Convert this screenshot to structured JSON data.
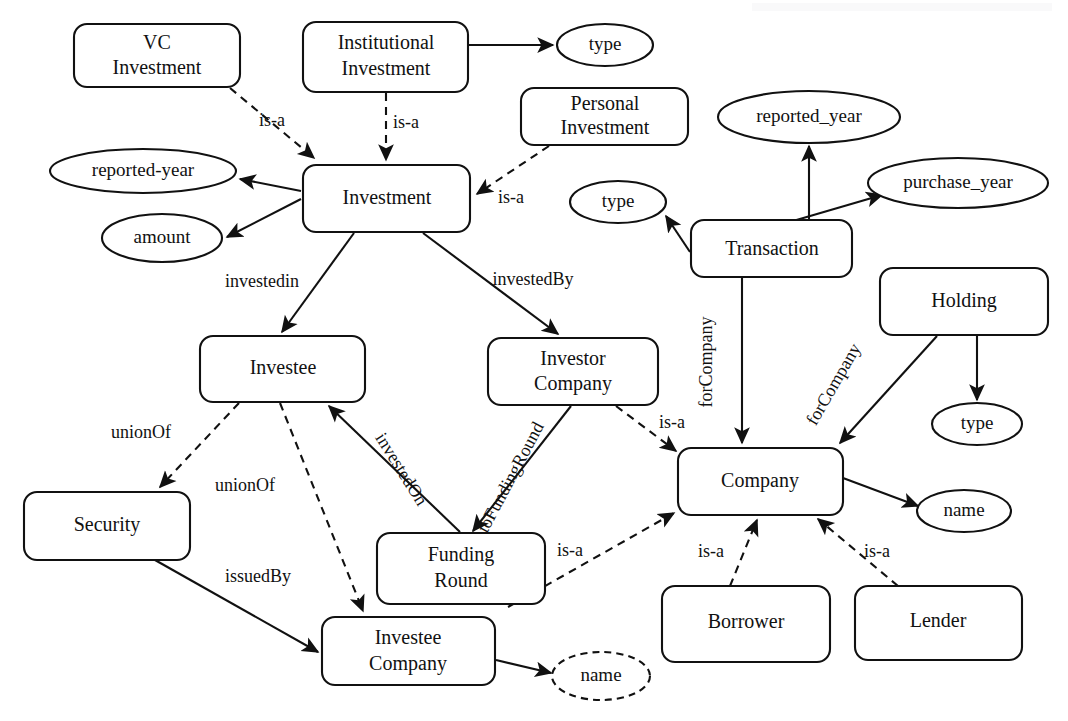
{
  "diagram": {
    "type": "ontology-graph",
    "canvas": {
      "width": 1068,
      "height": 721
    },
    "colors": {
      "stroke": "#111111",
      "background": "#ffffff"
    },
    "classes": [
      {
        "id": "vc_investment",
        "label_line1": "VC",
        "label_line2": "Investment",
        "shape": "rounded-rect",
        "x": 74,
        "y": 24,
        "w": 166,
        "h": 63
      },
      {
        "id": "institutional",
        "label_line1": "Institutional",
        "label_line2": "Investment",
        "shape": "rounded-rect",
        "x": 303,
        "y": 22,
        "w": 165,
        "h": 70
      },
      {
        "id": "personal",
        "label_line1": "Personal",
        "label_line2": "Investment",
        "shape": "rounded-rect",
        "x": 521,
        "y": 88,
        "w": 167,
        "h": 57
      },
      {
        "id": "investment",
        "label_line1": "Investment",
        "label_line2": "",
        "shape": "rounded-rect",
        "x": 303,
        "y": 165,
        "w": 167,
        "h": 67
      },
      {
        "id": "transaction",
        "label_line1": "Transaction",
        "label_line2": "",
        "shape": "rounded-rect",
        "x": 691,
        "y": 220,
        "w": 161,
        "h": 57
      },
      {
        "id": "holding",
        "label_line1": "Holding",
        "label_line2": "",
        "shape": "rounded-rect",
        "x": 880,
        "y": 268,
        "w": 168,
        "h": 67
      },
      {
        "id": "investee",
        "label_line1": "Investee",
        "label_line2": "",
        "shape": "rounded-rect",
        "x": 200,
        "y": 336,
        "w": 165,
        "h": 66
      },
      {
        "id": "investor_company",
        "label_line1": "Investor",
        "label_line2": "Company",
        "shape": "rounded-rect",
        "x": 488,
        "y": 338,
        "w": 170,
        "h": 67
      },
      {
        "id": "company",
        "label_line1": "Company",
        "label_line2": "",
        "shape": "rounded-rect",
        "x": 678,
        "y": 448,
        "w": 165,
        "h": 67
      },
      {
        "id": "security",
        "label_line1": "Security",
        "label_line2": "",
        "shape": "rounded-rect",
        "x": 24,
        "y": 492,
        "w": 166,
        "h": 68
      },
      {
        "id": "funding_round",
        "label_line1": "Funding",
        "label_line2": "Round",
        "shape": "rounded-rect",
        "x": 377,
        "y": 533,
        "w": 168,
        "h": 71
      },
      {
        "id": "investee_company",
        "label_line1": "Investee",
        "label_line2": "Company",
        "shape": "rounded-rect",
        "x": 322,
        "y": 617,
        "w": 173,
        "h": 68
      },
      {
        "id": "borrower",
        "label_line1": "Borrower",
        "label_line2": "",
        "shape": "rounded-rect",
        "x": 662,
        "y": 586,
        "w": 168,
        "h": 76
      },
      {
        "id": "lender",
        "label_line1": "Lender",
        "label_line2": "",
        "shape": "rounded-rect",
        "x": 855,
        "y": 586,
        "w": 167,
        "h": 74
      }
    ],
    "properties": [
      {
        "id": "type_institutional",
        "label": "type",
        "shape": "ellipse",
        "cx": 605,
        "cy": 45,
        "rx": 48,
        "ry": 21,
        "dashed": false
      },
      {
        "id": "reported_year_dash",
        "label": "reported-year",
        "shape": "ellipse",
        "cx": 143,
        "cy": 171,
        "rx": 93,
        "ry": 22,
        "dashed": false
      },
      {
        "id": "amount",
        "label": "amount",
        "shape": "ellipse",
        "cx": 162,
        "cy": 238,
        "rx": 60,
        "ry": 24,
        "dashed": false
      },
      {
        "id": "reported_year_us",
        "label": "reported_year",
        "shape": "ellipse",
        "cx": 809,
        "cy": 117,
        "rx": 91,
        "ry": 26,
        "dashed": false
      },
      {
        "id": "purchase_year",
        "label": "purchase_year",
        "shape": "ellipse",
        "cx": 958,
        "cy": 183,
        "rx": 90,
        "ry": 25,
        "dashed": false
      },
      {
        "id": "type_transaction",
        "label": "type",
        "shape": "ellipse",
        "cx": 618,
        "cy": 202,
        "rx": 48,
        "ry": 21,
        "dashed": false
      },
      {
        "id": "type_holding",
        "label": "type",
        "shape": "ellipse",
        "cx": 977,
        "cy": 424,
        "rx": 45,
        "ry": 21,
        "dashed": false
      },
      {
        "id": "name_company",
        "label": "name",
        "shape": "ellipse",
        "cx": 964,
        "cy": 511,
        "rx": 47,
        "ry": 21,
        "dashed": false
      },
      {
        "id": "name_investee_co",
        "label": "name",
        "shape": "ellipse",
        "cx": 601,
        "cy": 676,
        "rx": 49,
        "ry": 24,
        "dashed": true
      }
    ],
    "edges": [
      {
        "id": "e1",
        "from": "vc_investment",
        "to": "investment",
        "label": "is-a",
        "style": "dashed",
        "label_x": 272,
        "label_y": 122,
        "rotate": 0
      },
      {
        "id": "e2",
        "from": "institutional",
        "to": "investment",
        "label": "is-a",
        "style": "dashed",
        "label_x": 406,
        "label_y": 124,
        "rotate": 0
      },
      {
        "id": "e3",
        "from": "institutional",
        "to": "type_institutional",
        "label": "",
        "style": "solid",
        "label_x": 0,
        "label_y": 0,
        "rotate": 0
      },
      {
        "id": "e4",
        "from": "personal",
        "to": "investment",
        "label": "is-a",
        "style": "dashed",
        "label_x": 511,
        "label_y": 199,
        "rotate": 0
      },
      {
        "id": "e5",
        "from": "investment",
        "to": "reported_year_dash",
        "label": "",
        "style": "solid",
        "label_x": 0,
        "label_y": 0,
        "rotate": 0
      },
      {
        "id": "e6",
        "from": "investment",
        "to": "amount",
        "label": "",
        "style": "solid",
        "label_x": 0,
        "label_y": 0,
        "rotate": 0
      },
      {
        "id": "e7",
        "from": "investment",
        "to": "investee",
        "label": "investedin",
        "style": "solid",
        "label_x": 262,
        "label_y": 283,
        "rotate": 0
      },
      {
        "id": "e8",
        "from": "investment",
        "to": "investor_company",
        "label": "investedBy",
        "style": "solid",
        "label_x": 533,
        "label_y": 281,
        "rotate": 0
      },
      {
        "id": "e9",
        "from": "transaction",
        "to": "reported_year_us",
        "label": "",
        "style": "solid",
        "label_x": 0,
        "label_y": 0,
        "rotate": 0
      },
      {
        "id": "e10",
        "from": "transaction",
        "to": "purchase_year",
        "label": "",
        "style": "solid",
        "label_x": 0,
        "label_y": 0,
        "rotate": 0
      },
      {
        "id": "e11",
        "from": "transaction",
        "to": "type_transaction",
        "label": "",
        "style": "solid",
        "label_x": 0,
        "label_y": 0,
        "rotate": 0
      },
      {
        "id": "e12",
        "from": "transaction",
        "to": "company",
        "label": "forCompany",
        "style": "solid",
        "label_x": 708,
        "label_y": 362,
        "rotate": -90
      },
      {
        "id": "e13",
        "from": "holding",
        "to": "company",
        "label": "forCompany",
        "style": "solid",
        "label_x": 835,
        "label_y": 385,
        "rotate": -60
      },
      {
        "id": "e14",
        "from": "holding",
        "to": "type_holding",
        "label": "",
        "style": "solid",
        "label_x": 0,
        "label_y": 0,
        "rotate": 0
      },
      {
        "id": "e15",
        "from": "company",
        "to": "name_company",
        "label": "",
        "style": "solid",
        "label_x": 0,
        "label_y": 0,
        "rotate": 0
      },
      {
        "id": "e16",
        "from": "investee",
        "to": "security",
        "label": "unionOf",
        "style": "dashed",
        "label_x": 141,
        "label_y": 434,
        "rotate": 0
      },
      {
        "id": "e17",
        "from": "investee",
        "to": "investee_company",
        "label": "unionOf",
        "style": "dashed",
        "label_x": 245,
        "label_y": 487,
        "rotate": 0
      },
      {
        "id": "e18",
        "from": "funding_round",
        "to": "investee",
        "label": "investedOn",
        "style": "solid",
        "label_x": 400,
        "label_y": 470,
        "rotate": 58
      },
      {
        "id": "e19",
        "from": "investor_company",
        "to": "funding_round",
        "label": "toFundingRound",
        "style": "solid",
        "label_x": 512,
        "label_y": 478,
        "rotate": -62
      },
      {
        "id": "e20",
        "from": "investor_company",
        "to": "company",
        "label": "is-a",
        "style": "dashed",
        "label_x": 672,
        "label_y": 424,
        "rotate": 0
      },
      {
        "id": "e21",
        "from": "funding_round",
        "to": "company",
        "label": "is-a",
        "style": "dashed",
        "label_x": 570,
        "label_y": 552,
        "rotate": 0
      },
      {
        "id": "e22",
        "from": "security",
        "to": "investee_company",
        "label": "issuedBy",
        "style": "solid",
        "label_x": 258,
        "label_y": 578,
        "rotate": 0
      },
      {
        "id": "e23",
        "from": "investee_company",
        "to": "name_investee_co",
        "label": "",
        "style": "solid",
        "label_x": 0,
        "label_y": 0,
        "rotate": 0
      },
      {
        "id": "e24",
        "from": "borrower",
        "to": "company",
        "label": "is-a",
        "style": "dashed",
        "label_x": 711,
        "label_y": 553,
        "rotate": 0
      },
      {
        "id": "e25",
        "from": "lender",
        "to": "company",
        "label": "is-a",
        "style": "dashed",
        "label_x": 877,
        "label_y": 553,
        "rotate": 0
      }
    ]
  }
}
